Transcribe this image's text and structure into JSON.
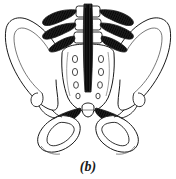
{
  "figure": {
    "caption": "(b)",
    "style": "black and white pen-and-ink line drawing with cross-hatched shading",
    "background_color": "#ffffff",
    "line_color": "#1a1a1a",
    "shading_color": "#111111"
  },
  "anatomy": {
    "parts": [
      {
        "id": "lumbar-vertebrae",
        "label": "lumbar vertebrae"
      },
      {
        "id": "spinous-process-band",
        "label": "spinous processes / supraspinous ligament"
      },
      {
        "id": "transverse-processes-left",
        "label": "left transverse processes"
      },
      {
        "id": "transverse-processes-right",
        "label": "right transverse processes"
      },
      {
        "id": "iliolumbar-ligament-left",
        "label": "left iliolumbar ligament"
      },
      {
        "id": "iliolumbar-ligament-right",
        "label": "right iliolumbar ligament"
      },
      {
        "id": "iliac-crest-left",
        "label": "left iliac crest"
      },
      {
        "id": "iliac-crest-right",
        "label": "right iliac crest"
      },
      {
        "id": "ilium-left",
        "label": "left ilium"
      },
      {
        "id": "ilium-right",
        "label": "right ilium"
      },
      {
        "id": "sacrum",
        "label": "sacrum"
      },
      {
        "id": "median-sacral-crest",
        "label": "median sacral crest"
      },
      {
        "id": "sacral-foramina-left",
        "label": "left posterior sacral foramina"
      },
      {
        "id": "sacral-foramina-right",
        "label": "right posterior sacral foramina"
      },
      {
        "id": "sacroiliac-ligament-left",
        "label": "left posterior sacroiliac ligament"
      },
      {
        "id": "sacroiliac-ligament-right",
        "label": "right posterior sacroiliac ligament"
      },
      {
        "id": "sacrotuberous-ligament-left",
        "label": "left sacrotuberous ligament"
      },
      {
        "id": "sacrotuberous-ligament-right",
        "label": "right sacrotuberous ligament"
      },
      {
        "id": "coccyx",
        "label": "coccyx"
      },
      {
        "id": "ischium-left",
        "label": "left ischium and ischial tuberosity"
      },
      {
        "id": "ischium-right",
        "label": "right ischium and ischial tuberosity"
      },
      {
        "id": "obturator-foramen-left",
        "label": "left obturator foramen"
      },
      {
        "id": "obturator-foramen-right",
        "label": "right obturator foramen"
      }
    ],
    "sacral_foramina_count_per_side": 4
  }
}
